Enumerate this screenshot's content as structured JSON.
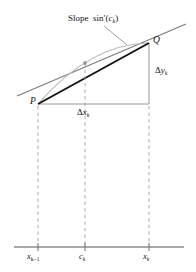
{
  "figure": {
    "labels": {
      "slope_text": "Slope",
      "slope_function": "sin",
      "slope_prime": "′",
      "slope_arg_open": "(",
      "slope_arg": "c",
      "slope_arg_sub": "k",
      "slope_arg_close": ")",
      "point_p": "P",
      "point_q": "Q",
      "delta_y_symbol": "Δ",
      "delta_y_var": "y",
      "delta_y_sub": "k",
      "delta_x_symbol": "Δ",
      "delta_x_var": "x",
      "delta_x_sub": "k",
      "axis_left_var": "x",
      "axis_left_sub": "k−1",
      "axis_mid_var": "c",
      "axis_mid_sub": "k",
      "axis_right_var": "x",
      "axis_right_sub": "k"
    },
    "colors": {
      "chord": "#111111",
      "tangent": "#7a7a7a",
      "curve": "#b9b9b9",
      "triangle_leg": "#8c8c8c",
      "dashed_drop": "#9a9a9a",
      "axis": "#8c8c8c",
      "tick": "#6f6f6f",
      "leader": "#8c8c8c",
      "marker": "#9a9a9a",
      "text": "#141414",
      "background": "#ffffff"
    },
    "geometry": {
      "point_p": [
        38,
        104
      ],
      "point_q": [
        149,
        43
      ],
      "tangent_point": [
        85,
        63
      ],
      "axis_y": 247,
      "drop_x_left": 38,
      "drop_x_mid": 85,
      "drop_x_right": 149,
      "tangent_start": [
        17,
        96
      ],
      "tangent_end": [
        186,
        24
      ],
      "leader_start": [
        104,
        26
      ],
      "leader_end": [
        127,
        45
      ],
      "curve_control": [
        90,
        44
      ]
    }
  }
}
